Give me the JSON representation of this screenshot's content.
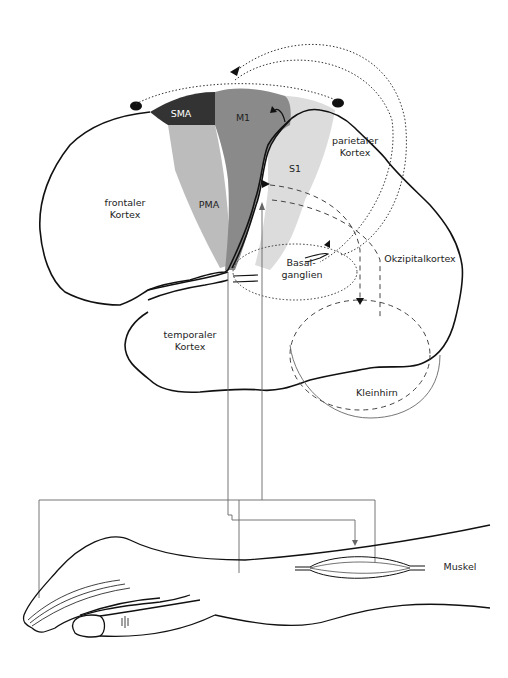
{
  "figure": {
    "title": "",
    "regions": {
      "sma": {
        "label": "SMA",
        "color": "#333333"
      },
      "m1": {
        "label": "M1",
        "color": "#8a8a8a"
      },
      "pma": {
        "label": "PMA",
        "color": "#bcbcbc"
      },
      "s1": {
        "label": "S1",
        "color": "#dcdcdc"
      }
    },
    "labels": {
      "parietal_1": "parietaler",
      "parietal_2": "Kortex",
      "frontal_1": "frontaler",
      "frontal_2": "Kortex",
      "basal_1": "Basal-",
      "basal_2": "ganglien",
      "occipital": "Okzipitalkortex",
      "temporal_1": "temporaler",
      "temporal_2": "Kortex",
      "cerebellum": "Kleinhirn",
      "muscle": "Muskel"
    },
    "colors": {
      "outline": "#111111",
      "pathway": "#555555"
    }
  }
}
